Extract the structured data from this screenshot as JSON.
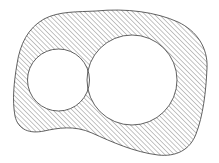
{
  "figure": {
    "background_color": "#ffffff",
    "stroke_color": "#3a3a3a",
    "hatch_color": "#555555",
    "hatch_angle_deg": -45,
    "hatch_spacing_px": 3.4,
    "hatch_line_width_px": 0.7,
    "outline_width_px": 0.8,
    "canvas": {
      "width": 219,
      "height": 163
    }
  },
  "shapes": {
    "outer_region": {
      "name": "hatched-blob",
      "kind": "closed-curve",
      "filled": "hatch",
      "bounds": {
        "left": 13,
        "top": 10,
        "right": 208,
        "bottom": 156
      },
      "path": "M 96 11 C 126 8 156 12 178 22 C 197 31 208 48 207 68 C 206 92 203 116 196 134 C 190 150 176 157 158 155 C 134 152 112 142 92 133 C 74 125 58 128 44 131 C 30 134 18 130 15 116 C 12 100 14 82 17 64 C 20 44 28 28 44 19 C 59 11 78 12 96 11 Z"
    },
    "holes": [
      {
        "name": "small-circle-hole",
        "kind": "circle",
        "cx": 58.5,
        "cy": 80.0,
        "r": 31.0,
        "fill": "#ffffff"
      },
      {
        "name": "large-circle-hole",
        "kind": "circle",
        "cx": 132.0,
        "cy": 80.0,
        "r": 45.0,
        "fill": "#ffffff"
      }
    ],
    "tangency": {
      "note": "The two circles touch at a single point between them.",
      "point_x": 88.5,
      "point_y": 80.0
    }
  },
  "labels": {
    "visible_text": []
  }
}
